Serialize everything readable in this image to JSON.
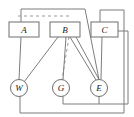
{
  "diagram": {
    "width": 134,
    "height": 117,
    "background_color": "#ffffff",
    "stroke_color": "#6e6e6e",
    "label_color": "#1a1a1a",
    "box_fill": "#ffffff",
    "circle_fill": "#ffffff",
    "box_nodes": [
      {
        "id": "A",
        "label": "A",
        "x": 9,
        "y": 22,
        "w": 30,
        "h": 15,
        "cx": 24,
        "cy": 29.5
      },
      {
        "id": "B",
        "label": "B",
        "x": 50,
        "y": 22,
        "w": 30,
        "h": 15,
        "cx": 65,
        "cy": 29.5
      },
      {
        "id": "C",
        "label": "C",
        "x": 91,
        "y": 22,
        "w": 27,
        "h": 15,
        "cx": 104.5,
        "cy": 29.5
      }
    ],
    "circle_nodes": [
      {
        "id": "W",
        "label": "W",
        "cx": 19,
        "cy": 88,
        "r": 8.5
      },
      {
        "id": "G",
        "label": "G",
        "cx": 61,
        "cy": 88,
        "r": 8.5
      },
      {
        "id": "E",
        "label": "E",
        "cx": 99,
        "cy": 88,
        "r": 8.5
      }
    ],
    "solid_edges": [
      {
        "id": "A-W",
        "from": "A",
        "to": "W",
        "x1": 21,
        "y1": 37,
        "x2": 19,
        "y2": 79.5
      },
      {
        "id": "B-W",
        "from": "B",
        "to": "W",
        "x1": 58,
        "y1": 37,
        "x2": 24,
        "y2": 82
      },
      {
        "id": "B-G",
        "from": "B",
        "to": "G",
        "x1": 66,
        "y1": 37,
        "x2": 63,
        "y2": 79.5
      },
      {
        "id": "B-E1",
        "from": "B",
        "to": "E",
        "x1": 70,
        "y1": 37,
        "x2": 96,
        "y2": 80
      },
      {
        "id": "B-E2",
        "from": "B",
        "to": "E",
        "x1": 76,
        "y1": 37,
        "x2": 99,
        "y2": 79.5
      },
      {
        "id": "C-E",
        "from": "C",
        "to": "E",
        "x1": 102,
        "y1": 37,
        "x2": 101,
        "y2": 79.5
      }
    ],
    "dashed_edges": [
      {
        "id": "A-B-dashed",
        "from": "A",
        "to": "B",
        "x1": 18,
        "y1": 16,
        "x2": 69,
        "y2": 16
      },
      {
        "id": "B-G-dashed",
        "from": "B",
        "to": "G",
        "x1": 69,
        "y1": 37,
        "x2": 62,
        "y2": 79.5
      }
    ],
    "routing_wires": [
      {
        "id": "wire-A-top-to-E",
        "points": "21,22 21,9 85,9 99,79.5"
      },
      {
        "id": "wire-C-top-loop",
        "points": "100,22 100,10 124,10 124,113 20,113 20,96.5"
      },
      {
        "id": "wire-C-right-loop",
        "points": "118,31 128,31 128,104 63,104 63,96.5"
      },
      {
        "id": "wire-E-bottom",
        "points": "99,96.5 99,104"
      }
    ],
    "dash_pattern": "3,3",
    "stroke_width": 1
  }
}
